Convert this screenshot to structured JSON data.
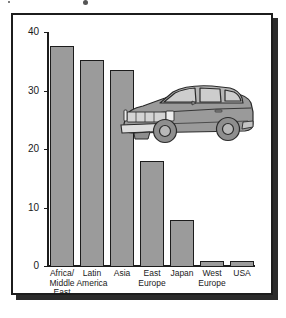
{
  "figure": {
    "frame_color": "#1c1c1c",
    "shadow_color": "#2b2b2b",
    "background": "#ffffff"
  },
  "illustration": {
    "name": "car-illustration",
    "description": "gray two-door sedan facing left",
    "body_color": "#9a9a9a",
    "outline_color": "#2a2a2a",
    "glass_color": "#c9c9c9"
  },
  "chart_data": {
    "type": "bar",
    "title": "",
    "subtitle": "",
    "xlabel": "",
    "ylabel": "",
    "categories": [
      "Africa/\nMiddle\nEast",
      "Latin\nAmerica",
      "Asia",
      "East\nEurope",
      "Japan",
      "West\nEurope",
      "USA"
    ],
    "values": [
      37.7,
      35.3,
      33.5,
      18.0,
      8.0,
      1.0,
      1.0
    ],
    "ylim": [
      0,
      40
    ],
    "yticks": [
      0,
      10,
      20,
      30,
      40
    ],
    "ytick_labels": [
      "0",
      "10",
      "20",
      "30",
      "40"
    ],
    "grid": false,
    "legend": "none",
    "bar_fill": "#9b9b9b",
    "bar_outline": "#1c1c1c",
    "axis_color": "#1c1c1c"
  }
}
